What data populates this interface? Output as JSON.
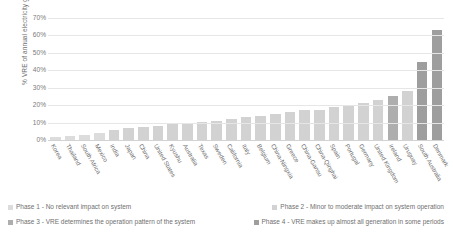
{
  "chart_data": {
    "type": "bar",
    "title": "",
    "xlabel": "",
    "ylabel": "% VRE of annual electricity generation",
    "ylim": [
      0,
      70
    ],
    "ytick_labels": [
      "70%",
      "60%",
      "50%",
      "40%",
      "30%",
      "20%",
      "10%",
      "0%"
    ],
    "ytick_values": [
      70,
      60,
      50,
      40,
      30,
      20,
      10,
      0
    ],
    "grid": true,
    "legend_position": "bottom",
    "categories": [
      "Korea",
      "Thailand",
      "South Africa",
      "Mexico",
      "India",
      "Japan",
      "China",
      "United States",
      "Kyushu",
      "Australia",
      "Texas",
      "Sweden",
      "California",
      "Italy",
      "Belgium",
      "China-Ningxia",
      "Greece",
      "China-Gansu",
      "China-Qinghai",
      "Spain",
      "Portugal",
      "Germany",
      "United Kingdom",
      "Ireland",
      "Uruguay",
      "South Australia",
      "Denmark"
    ],
    "values": [
      1.5,
      2.5,
      3,
      4,
      6,
      7,
      7.5,
      8,
      9,
      10,
      10.5,
      11,
      12,
      13,
      13.5,
      15,
      16,
      17,
      17.5,
      19,
      20,
      21.5,
      23,
      25,
      28,
      45,
      63
    ],
    "phases": [
      "Phase 1",
      "Phase 1",
      "Phase 1",
      "Phase 1",
      "Phase 2",
      "Phase 2",
      "Phase 2",
      "Phase 2",
      "Phase 2",
      "Phase 2",
      "Phase 2",
      "Phase 2",
      "Phase 2",
      "Phase 2",
      "Phase 2",
      "Phase 2",
      "Phase 2",
      "Phase 2",
      "Phase 2",
      "Phase 2",
      "Phase 2",
      "Phase 2",
      "Phase 2",
      "Phase 3",
      "Phase 2",
      "Phase 4",
      "Phase 4"
    ],
    "bar_colors": [
      "#dcdcdc",
      "#dcdcdc",
      "#dcdcdc",
      "#dcdcdc",
      "#d2d2d2",
      "#d2d2d2",
      "#d2d2d2",
      "#d2d2d2",
      "#d2d2d2",
      "#d2d2d2",
      "#d2d2d2",
      "#d2d2d2",
      "#d2d2d2",
      "#d2d2d2",
      "#d2d2d2",
      "#d2d2d2",
      "#d2d2d2",
      "#d2d2d2",
      "#d2d2d2",
      "#d2d2d2",
      "#d2d2d2",
      "#d2d2d2",
      "#d2d2d2",
      "#aeaeae",
      "#d2d2d2",
      "#9e9e9e",
      "#9e9e9e"
    ]
  },
  "legend": {
    "items": [
      {
        "label": "Phase 1 - No relevant impact on system",
        "color": "#dcdcdc"
      },
      {
        "label": "Phase 2 - Minor to moderate impact on system operation",
        "color": "#d2d2d2"
      },
      {
        "label": "Phase 3 - VRE determines the operation pattern of the system",
        "color": "#aeaeae"
      },
      {
        "label": "Phase 4 - VRE makes up almost all generation in some periods",
        "color": "#9e9e9e"
      }
    ]
  }
}
